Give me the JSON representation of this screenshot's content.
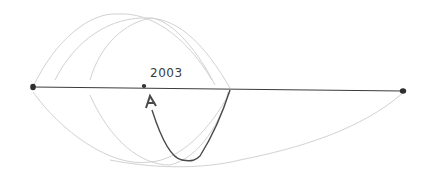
{
  "diagram": {
    "point_label": "2003",
    "colors": {
      "background": "#ffffff",
      "timeline": "#3c3c3c",
      "faint_arcs": "#d4d4d4",
      "arrow": "#4a4a4a"
    },
    "timeline": {
      "x1": 33,
      "y1": 87,
      "x2": 403,
      "y2": 91
    },
    "points": [
      {
        "name": "left-endpoint",
        "x": 33,
        "y": 87
      },
      {
        "name": "marked-point-2003",
        "x": 144,
        "y": 86
      },
      {
        "name": "right-endpoint",
        "x": 403,
        "y": 91
      }
    ]
  }
}
